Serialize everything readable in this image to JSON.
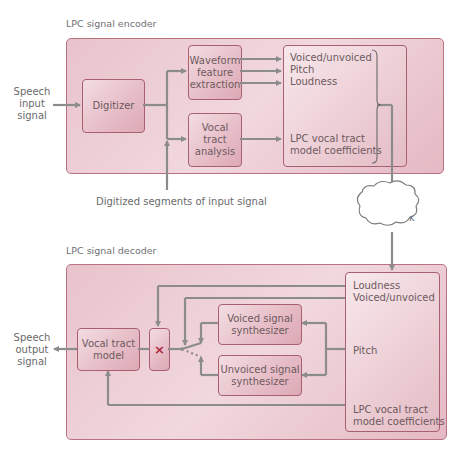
{
  "encoder": {
    "title": "LPC signal encoder",
    "input_label": [
      "Speech",
      "input",
      "signal"
    ],
    "digitizer": "Digitizer",
    "waveform_box": [
      "Waveform",
      "feature",
      "extraction"
    ],
    "vocal_tract_analysis_box": [
      "Vocal",
      "tract",
      "analysis"
    ],
    "params": {
      "voiced_unvoiced": "Voiced/unvoiced",
      "pitch": "Pitch",
      "loudness": "Loudness",
      "lpc_line1": "LPC vocal tract",
      "lpc_line2": "model coefficients"
    },
    "digitized_segments_label": "Digitized segments of input signal"
  },
  "network": {
    "label": "Network"
  },
  "decoder": {
    "title": "LPC signal decoder",
    "output_label": [
      "Speech",
      "output",
      "signal"
    ],
    "vocal_tract_model_box": [
      "Vocal tract",
      "model"
    ],
    "multiplier_symbol": "×",
    "voiced_synth_box": [
      "Voiced signal",
      "synthesizer"
    ],
    "unvoiced_synth_box": [
      "Unvoiced signal",
      "synthesizer"
    ],
    "params": {
      "loudness": "Loudness",
      "voiced_unvoiced": "Voiced/unvoiced",
      "pitch": "Pitch",
      "lpc_line1": "LPC vocal tract",
      "lpc_line2": "model coefficients"
    }
  },
  "colors": {
    "panel_fill": "#eac6ce",
    "panel_border": "#b9727f",
    "wire": "#8c8c8c",
    "multiplier": "#b0283c"
  }
}
